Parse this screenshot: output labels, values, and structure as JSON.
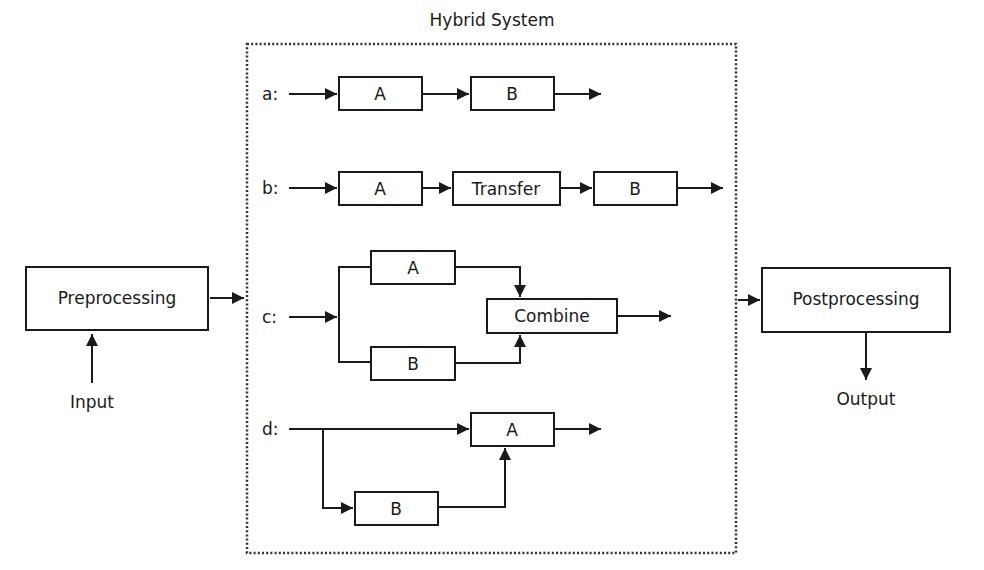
{
  "diagram": {
    "title": "Hybrid System",
    "colors": {
      "stroke": "#1a1a1a",
      "background": "#ffffff",
      "frame": "#333333"
    },
    "preprocessing": {
      "label": "Preprocessing",
      "input_label": "Input"
    },
    "postprocessing": {
      "label": "Postprocessing",
      "output_label": "Output"
    },
    "rows": {
      "a": {
        "label": "a:",
        "box1": "A",
        "box2": "B"
      },
      "b": {
        "label": "b:",
        "box1": "A",
        "box2": "Transfer",
        "box3": "B"
      },
      "c": {
        "label": "c:",
        "box_top": "A",
        "box_bottom": "B",
        "combine": "Combine"
      },
      "d": {
        "label": "d:",
        "box_main": "A",
        "box_side": "B"
      }
    }
  }
}
